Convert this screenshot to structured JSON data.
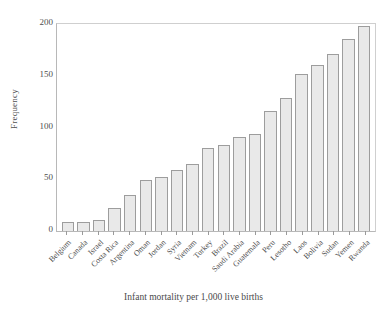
{
  "chart_data": {
    "type": "bar",
    "title": "",
    "xlabel": "Infant mortality per 1,000 live births",
    "ylabel": "Frequency",
    "ylim": [
      0,
      200
    ],
    "yticks": [
      0,
      50,
      100,
      150,
      200
    ],
    "ytick_labels": [
      "0",
      "50",
      "100",
      "150",
      "200"
    ],
    "grid": false,
    "legend": "none",
    "bar_color": "#e9e9e9",
    "bar_edge_color": "#9d9d9d",
    "axis_color": "#b8b8b8",
    "categories": [
      "Belgium",
      "Canada",
      "Israel",
      "Costa Rica",
      "Argentina",
      "Oman",
      "Jordan",
      "Syria",
      "Vietnam",
      "Turkey",
      "Brazil",
      "Saudi Arabia",
      "Guatemala",
      "Peru",
      "Lesotho",
      "Laos",
      "Bolivia",
      "Sudan",
      "Yemen",
      "Rwanda"
    ],
    "values": [
      9,
      9,
      11,
      22,
      35,
      49,
      52,
      59,
      65,
      80,
      83,
      91,
      94,
      116,
      129,
      152,
      160,
      171,
      186,
      198
    ]
  }
}
